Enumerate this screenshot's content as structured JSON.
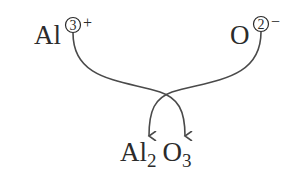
{
  "diagram": {
    "type": "crisscross-method",
    "cation": {
      "symbol": "Al",
      "charge_magnitude": "3",
      "charge_sign": "+"
    },
    "anion": {
      "symbol": "O",
      "charge_magnitude": "2",
      "charge_sign": "−"
    },
    "product": {
      "element1": "Al",
      "subscript1": "2",
      "element2": "O",
      "subscript2": "3"
    },
    "colors": {
      "text": "#2b2b2b",
      "line": "#4a4a4a",
      "background": "#ffffff"
    }
  }
}
